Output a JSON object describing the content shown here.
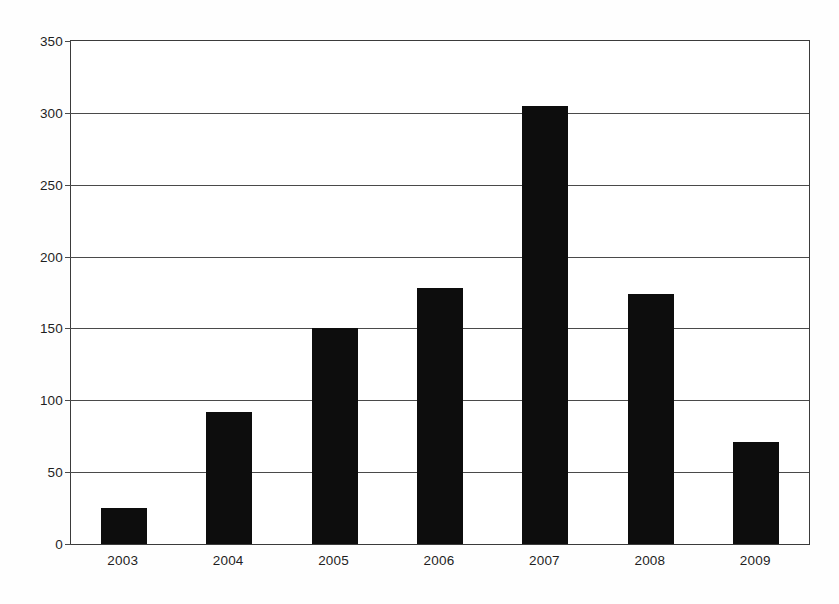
{
  "chart_data": {
    "type": "bar",
    "title": "",
    "subtitle": "",
    "xlabel": "",
    "ylabel": "",
    "categories": [
      "2003",
      "2004",
      "2005",
      "2006",
      "2007",
      "2008",
      "2009"
    ],
    "values": [
      25,
      92,
      150,
      178,
      305,
      174,
      71
    ],
    "ylim": [
      0,
      350
    ],
    "yticks": [
      0,
      50,
      100,
      150,
      200,
      250,
      300,
      350
    ],
    "ytick_labels": [
      "0",
      "50",
      "100",
      "150",
      "200",
      "250",
      "300",
      "350"
    ],
    "grid": true,
    "grid_axis": "y",
    "legend": false,
    "legend_position": "none",
    "bar_color": "#0d0d0d",
    "axis_color": "#3b3b3b",
    "background_color": "#ffffff"
  }
}
